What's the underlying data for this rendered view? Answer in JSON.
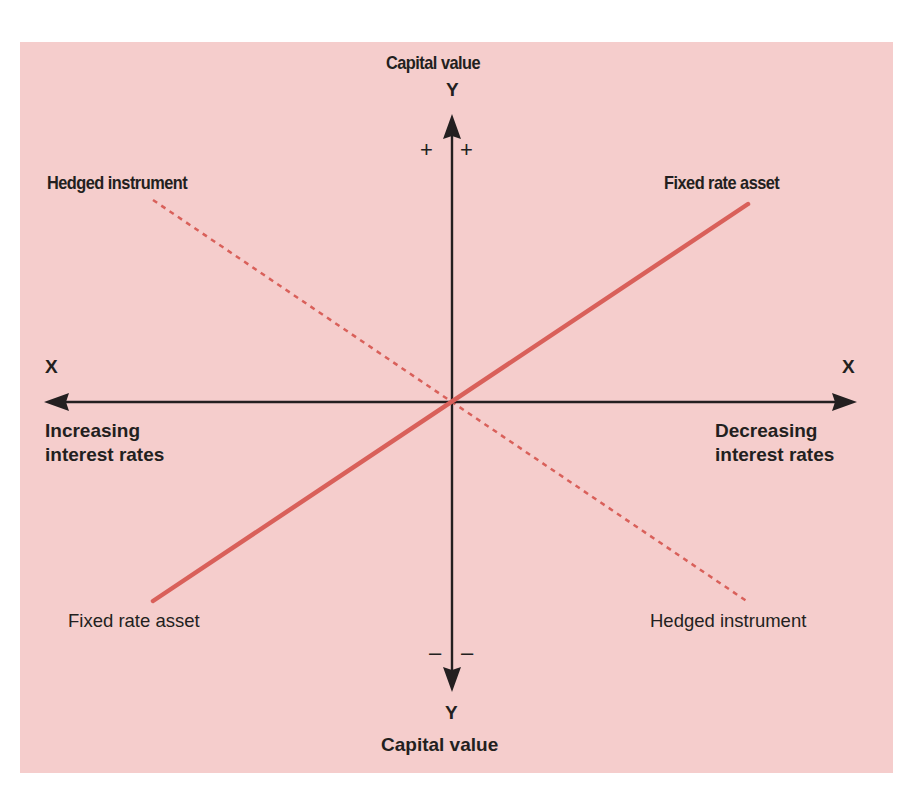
{
  "y_axis": {
    "top_title": "Capital value",
    "top_letter": "Y",
    "bottom_title": "Capital value",
    "bottom_letter": "Y",
    "plus_left": "+",
    "plus_right": "+",
    "minus_left": "–",
    "minus_right": "–"
  },
  "x_axis": {
    "left_letter": "X",
    "right_letter": "X",
    "left_label_line1": "Increasing",
    "left_label_line2": "interest rates",
    "right_label_line1": "Decreasing",
    "right_label_line2": "interest rates"
  },
  "lines": {
    "fixed_rate_asset": {
      "label_top": "Fixed rate asset",
      "label_bottom": "Fixed rate asset",
      "style": "solid",
      "color": "#d9605a"
    },
    "hedged_instrument": {
      "label_top": "Hedged instrument",
      "label_bottom": "Hedged instrument",
      "style": "dashed",
      "color": "#d9605a"
    }
  },
  "colors": {
    "background": "#f5cdcc",
    "axis": "#231f20",
    "line": "#d9605a"
  }
}
